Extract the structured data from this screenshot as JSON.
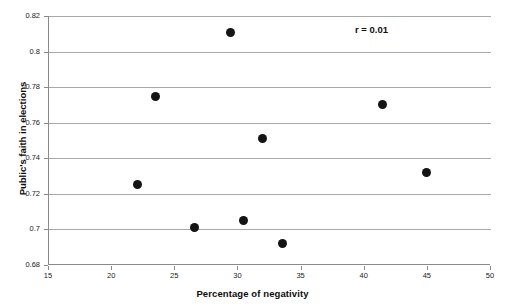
{
  "chart_data": {
    "type": "scatter",
    "title": "",
    "xlabel": "Percentage of negativity",
    "ylabel": "Public's faith in elections",
    "xlim": [
      15,
      50
    ],
    "ylim": [
      0.68,
      0.82
    ],
    "xticks": [
      15,
      20,
      25,
      30,
      35,
      40,
      45,
      50
    ],
    "xtick_labels": [
      "15",
      "20",
      "25",
      "30",
      "35",
      "40",
      "45",
      "50"
    ],
    "yticks": [
      0.68,
      0.7,
      0.72,
      0.74,
      0.76,
      0.78,
      0.8,
      0.82
    ],
    "ytick_labels": [
      "0.68",
      "0.7",
      "0.72",
      "0.74",
      "0.76",
      "0.78",
      "0.8",
      "0.82"
    ],
    "grid": "horizontal",
    "legend": "none",
    "marker": "filled-circle",
    "marker_color": "#141414",
    "points": [
      {
        "x": 22.0,
        "y": 0.725
      },
      {
        "x": 23.4,
        "y": 0.775
      },
      {
        "x": 26.5,
        "y": 0.701
      },
      {
        "x": 29.4,
        "y": 0.811
      },
      {
        "x": 30.4,
        "y": 0.705
      },
      {
        "x": 31.9,
        "y": 0.751
      },
      {
        "x": 33.5,
        "y": 0.692
      },
      {
        "x": 41.4,
        "y": 0.77
      },
      {
        "x": 44.9,
        "y": 0.732
      }
    ],
    "annotations": [
      {
        "text": "r = 0.01",
        "x": 44.0,
        "y": 0.8155
      }
    ]
  },
  "annotation": {
    "correlation_label": "r = 0.01"
  },
  "axes": {
    "x_title": "Percentage of negativity",
    "y_title": "Public's faith in elections"
  },
  "colors": {
    "marker": "#141414",
    "gridline": "#a9a9a9",
    "axis": "#8a8a8a",
    "background": "#ffffff",
    "text": "#0d0d0d"
  }
}
